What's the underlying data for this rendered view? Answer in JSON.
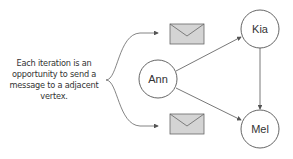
{
  "annotation": {
    "lines": [
      "Each iteration is an",
      "opportunity to send a",
      "message to a adjacent",
      "vertex."
    ]
  },
  "nodes": [
    {
      "id": "ann",
      "label": "Ann"
    },
    {
      "id": "kia",
      "label": "Kia"
    },
    {
      "id": "mel",
      "label": "Mel"
    }
  ],
  "edges": [
    {
      "from": "Ann",
      "to": "Kia"
    },
    {
      "from": "Ann",
      "to": "Mel"
    },
    {
      "from": "Kia",
      "to": "Mel"
    }
  ],
  "icons": [
    "envelope-icon",
    "envelope-icon"
  ],
  "colors": {
    "stroke": "#555555",
    "envelope_fill": "#d4d4d4",
    "text": "#333333"
  }
}
